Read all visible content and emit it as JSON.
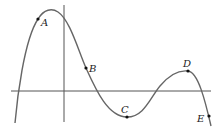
{
  "diagram": {
    "type": "function-graph",
    "colors": {
      "curve": "#666666",
      "axes": "#555555",
      "points": "#111111",
      "labels": "#222222"
    },
    "points": [
      {
        "label": "A",
        "x": 38,
        "y": 19,
        "lx": 42,
        "ly": 25
      },
      {
        "label": "B",
        "x": 86,
        "y": 68,
        "lx": 90,
        "ly": 71
      },
      {
        "label": "C",
        "x": 127,
        "y": 117,
        "lx": 122,
        "ly": 113
      },
      {
        "label": "D",
        "x": 188,
        "y": 71,
        "lx": 182,
        "ly": 67
      },
      {
        "label": "E",
        "x": 209,
        "y": 116,
        "lx": 197,
        "ly": 121
      }
    ]
  }
}
